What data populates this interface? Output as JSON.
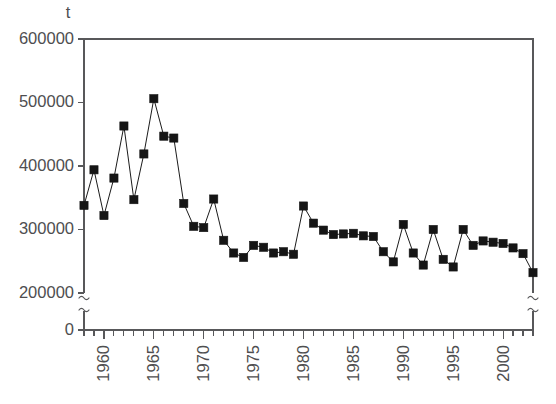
{
  "chart_data": {
    "type": "line",
    "title": "",
    "subtitle": "",
    "xlabel": "",
    "ylabel": "",
    "unit_label": "t",
    "grid": false,
    "legend": null,
    "marker": "filled-square",
    "xlim": [
      1958,
      2003
    ],
    "ylim": [
      200000,
      600000
    ],
    "y_axis_break": true,
    "x_axis_break": true,
    "yticks": [
      0,
      200000,
      300000,
      400000,
      500000,
      600000
    ],
    "ytick_labels": [
      "0",
      "200000",
      "300000",
      "400000",
      "500000",
      "600000"
    ],
    "xticks": [
      1960,
      1965,
      1970,
      1975,
      1980,
      1985,
      1990,
      1995,
      2000
    ],
    "xtick_labels": [
      "1960",
      "1965",
      "1970",
      "1975",
      "1980",
      "1985",
      "1990",
      "1995",
      "2000"
    ],
    "x_minor_tick_step": 1,
    "x": [
      1958,
      1959,
      1960,
      1961,
      1962,
      1963,
      1964,
      1965,
      1966,
      1967,
      1968,
      1969,
      1970,
      1971,
      1972,
      1973,
      1974,
      1975,
      1976,
      1977,
      1978,
      1979,
      1980,
      1981,
      1982,
      1983,
      1984,
      1985,
      1986,
      1987,
      1988,
      1989,
      1990,
      1991,
      1992,
      1993,
      1994,
      1995,
      1996,
      1997,
      1998,
      1999,
      2000,
      2001,
      2002,
      2003
    ],
    "values": [
      338000,
      394000,
      322000,
      381000,
      463000,
      347000,
      419000,
      506000,
      447000,
      444000,
      341000,
      305000,
      303000,
      348000,
      283000,
      263000,
      256000,
      275000,
      272000,
      263000,
      265000,
      261000,
      337000,
      310000,
      299000,
      292000,
      293000,
      294000,
      290000,
      289000,
      265000,
      249000,
      308000,
      263000,
      244000,
      300000,
      253000,
      241000,
      300000,
      275000,
      282000,
      280000,
      278000,
      271000,
      262000,
      232000
    ],
    "series_name": "annual catch",
    "colors": {
      "axis": "#58585a",
      "marker": "#151515",
      "line": "#1b1b1b",
      "text": "#4e4e50",
      "background": "#ffffff"
    }
  },
  "figure": {
    "unit_caption": "t"
  }
}
